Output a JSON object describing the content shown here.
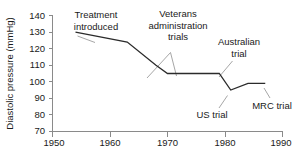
{
  "chart_data": {
    "type": "line",
    "title": "",
    "xlabel": "",
    "ylabel": "Diastolic pressure (mmHg)",
    "xlim": [
      1950,
      1990
    ],
    "ylim": [
      70,
      140
    ],
    "grid": false,
    "legend": "none",
    "x_ticks": [
      "1950",
      "1960",
      "1970",
      "1980",
      "1990"
    ],
    "x_tick_values": [
      1950,
      1960,
      1970,
      1980,
      1990
    ],
    "y_ticks": [
      "70",
      "80",
      "90",
      "100",
      "110",
      "120",
      "130",
      "140"
    ],
    "y_tick_values": [
      70,
      80,
      90,
      100,
      110,
      120,
      130,
      140
    ],
    "series": [
      {
        "name": "Diastolic pressure threshold for treatment",
        "color": "#2b2b2b",
        "x": [
          1954,
          1963,
          1968,
          1970,
          1979,
          1981,
          1984,
          1987
        ],
        "y": [
          130,
          124,
          110,
          105,
          105,
          95,
          99,
          99
        ]
      }
    ],
    "annotations": [
      {
        "id": "treatment-introduced",
        "text": "Treatment introduced",
        "lines": [
          "Treatment",
          "introduced"
        ],
        "x": 1961.5,
        "y": 139
      },
      {
        "id": "veterans-administration-trials",
        "text": "Veterans administration trials",
        "lines": [
          "Veterans",
          "administration",
          "trials"
        ],
        "x": 1971.5,
        "y": 140
      },
      {
        "id": "australian-trial",
        "text": "Australian trial",
        "lines": [
          "Australian",
          "trial"
        ],
        "x": 1980.0,
        "y": 124
      },
      {
        "id": "us-trial",
        "text": "US trial",
        "lines": [
          "US trial"
        ],
        "x": 1979.0,
        "y": 80
      },
      {
        "id": "mrc-trial",
        "text": "MRC trial",
        "lines": [
          "MRC trial"
        ],
        "x": 1987.5,
        "y": 85
      }
    ]
  },
  "labels": {
    "y_axis_title": "Diastolic pressure (mmHg)",
    "y70": "70",
    "y80": "80",
    "y90": "90",
    "y100": "100",
    "y110": "110",
    "y120": "120",
    "y130": "130",
    "y140": "140",
    "x1950": "1950",
    "x1960": "1960",
    "x1970": "1970",
    "x1980": "1980",
    "x1990": "1990",
    "a_treatment_1": "Treatment",
    "a_treatment_2": "introduced",
    "a_veterans_1": "Veterans",
    "a_veterans_2": "administration",
    "a_veterans_3": "trials",
    "a_australian_1": "Australian",
    "a_australian_2": "trial",
    "a_us_1": "US trial",
    "a_mrc_1": "MRC trial"
  },
  "colors": {
    "line": "#2b2b2b",
    "axis": "#8a8a8a",
    "leader": "#8f8f8f",
    "text": "#1a1a1a",
    "background": "#ffffff"
  }
}
